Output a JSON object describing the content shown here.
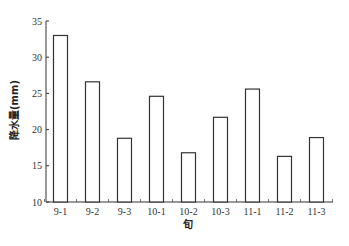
{
  "chart_data": {
    "type": "bar",
    "title": "",
    "xlabel": "旬",
    "ylabel": "降水量(mm)",
    "categories": [
      "9-1",
      "9-2",
      "9-3",
      "10-1",
      "10-2",
      "10-3",
      "11-1",
      "11-2",
      "11-3"
    ],
    "values": [
      33.0,
      26.6,
      18.8,
      24.6,
      16.8,
      21.7,
      25.6,
      16.3,
      18.9
    ],
    "ylim": [
      10,
      35
    ],
    "yticks": [
      10,
      15,
      20,
      25,
      30,
      35
    ],
    "grid": false,
    "legend": null,
    "bar_fill": "#ffffff",
    "bar_stroke": "#333333"
  }
}
